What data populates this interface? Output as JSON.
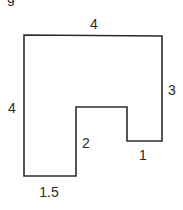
{
  "figure": {
    "partial_label": "g",
    "shape": {
      "type": "rectilinear-polygon",
      "stroke_color": "#2b2b2b",
      "fill_color": "#ffffff",
      "stroke_width": 1.6,
      "points": "24,35 162,36 162,141 127,141 127,107 76,107 76,176 24,176 24,35"
    },
    "dimensions": [
      {
        "id": "top",
        "value": "4",
        "x": 94,
        "y": 24
      },
      {
        "id": "right",
        "value": "3",
        "x": 172,
        "y": 90
      },
      {
        "id": "left",
        "value": "4",
        "x": 12,
        "y": 108
      },
      {
        "id": "notch-inner-left",
        "value": "2",
        "x": 86,
        "y": 143
      },
      {
        "id": "step-bottom",
        "value": "1",
        "x": 143,
        "y": 155
      },
      {
        "id": "bottom",
        "value": "1.5",
        "x": 49,
        "y": 192
      }
    ]
  }
}
